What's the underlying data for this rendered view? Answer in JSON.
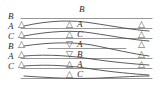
{
  "figure": {
    "title_label": "B",
    "background_color": "#ffffff",
    "line_color": "#8c8c8c",
    "text_color": "#2b2b2b",
    "triangle_color": "#5a5a5a",
    "glyphs": {
      "triangle_up": "△",
      "triangle_down": "▽"
    },
    "top_center_label": "B",
    "left_column": [
      {
        "label": "B",
        "has_triangle": false,
        "triangle": ""
      },
      {
        "label": "A",
        "has_triangle": true,
        "triangle": "△"
      },
      {
        "label": "C",
        "has_triangle": true,
        "triangle": "△"
      },
      {
        "label": "B",
        "has_triangle": true,
        "triangle": "△"
      },
      {
        "label": "A",
        "has_triangle": true,
        "triangle": "△"
      },
      {
        "label": "C",
        "has_triangle": true,
        "triangle": "△"
      }
    ],
    "center_column": [
      {
        "triangle": "△",
        "label": "A",
        "direction": "up"
      },
      {
        "triangle": "△",
        "label": "C",
        "direction": "up"
      },
      {
        "triangle": "▽",
        "label": "A",
        "direction": "down"
      },
      {
        "triangle": "▽",
        "label": "B",
        "direction": "down"
      },
      {
        "triangle": "△",
        "label": "A",
        "direction": "up"
      },
      {
        "triangle": "△",
        "label": "C",
        "direction": "up"
      }
    ],
    "right_column": [
      {
        "triangle": "△"
      },
      {
        "triangle": "△"
      },
      {
        "triangle": "△"
      },
      {
        "triangle": "△"
      },
      {
        "triangle": "△"
      }
    ]
  }
}
